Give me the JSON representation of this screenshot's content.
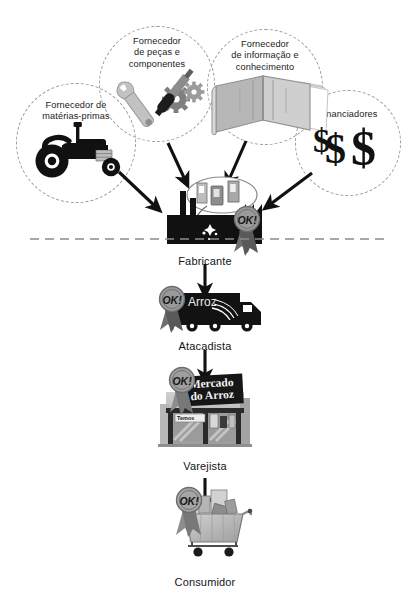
{
  "diagram": {
    "background_color": "#ffffff",
    "divider": {
      "name": "dashed-divider-line",
      "color": "#8c8c8c",
      "y": 239,
      "x1": 30,
      "x2": 386
    },
    "palette": {
      "black": "#111111",
      "dark_gray": "#3d3d3d",
      "mid_gray": "#8f8f8f",
      "light_gray": "#c3c3c3",
      "pale_gray": "#dedede",
      "dashed_stroke": "#9a9a9a",
      "text": "#141414"
    }
  },
  "suppliers": [
    {
      "id": "materias-primas",
      "label": "Fornecedor de\nmatérias-primas",
      "icon": "tractor-icon",
      "cx": 76,
      "cy": 143,
      "r": 60,
      "label_y": 104
    },
    {
      "id": "pecas-componentes",
      "label": "Fornecedor\nde peças e\ncomponentes",
      "icon": "wrench-screwdriver-gears-icon",
      "cx": 157,
      "cy": 84,
      "r": 58,
      "label_y": 37
    },
    {
      "id": "informacao-conhecimento",
      "label": "Fornecedor\nde informação e\nconhecimento",
      "icon": "open-book-icon",
      "cx": 265,
      "cy": 87,
      "r": 58,
      "label_y": 40
    },
    {
      "id": "financiadores",
      "label": "Financiadores",
      "icon": "dollar-signs-icon",
      "cx": 348,
      "cy": 143,
      "r": 53,
      "label_y": 110
    }
  ],
  "chain": [
    {
      "id": "fabricante",
      "label": "Fabricante",
      "icon": "factory-icon",
      "caption_y": 255,
      "badge": "OK!"
    },
    {
      "id": "atacadista",
      "label": "Atacadista",
      "icon": "delivery-truck-icon",
      "caption_y": 340,
      "badge": "OK!",
      "product_label": "Arroz"
    },
    {
      "id": "varejista",
      "label": "Varejista",
      "icon": "storefront-icon",
      "caption_y": 460,
      "badge": "OK!",
      "store_sign": "Mercado\ndo Arroz",
      "store_sub_sign": "Temos"
    },
    {
      "id": "consumidor",
      "label": "Consumidor",
      "icon": "shopping-cart-icon",
      "caption_y": 576,
      "badge": "OK!"
    }
  ],
  "badges": {
    "text": "OK!",
    "name": "ok-quality-seal"
  },
  "flows": [
    {
      "id": "flow-materias-to-fabricante",
      "from": "materias-primas",
      "to": "fabricante",
      "kind": "diagonal"
    },
    {
      "id": "flow-pecas-to-fabricante",
      "from": "pecas-componentes",
      "to": "fabricante",
      "kind": "vertical"
    },
    {
      "id": "flow-informacao-to-fabricante",
      "from": "informacao-conhecimento",
      "to": "fabricante",
      "kind": "vertical"
    },
    {
      "id": "flow-financiadores-to-fabricante",
      "from": "financiadores",
      "to": "fabricante",
      "kind": "diagonal"
    },
    {
      "id": "flow-fabricante-to-atacadista",
      "from": "fabricante",
      "to": "atacadista",
      "kind": "vertical"
    },
    {
      "id": "flow-atacadista-to-varejista",
      "from": "atacadista",
      "to": "varejista",
      "kind": "vertical"
    },
    {
      "id": "flow-varejista-to-consumidor",
      "from": "varejista",
      "to": "consumidor",
      "kind": "vertical"
    }
  ]
}
